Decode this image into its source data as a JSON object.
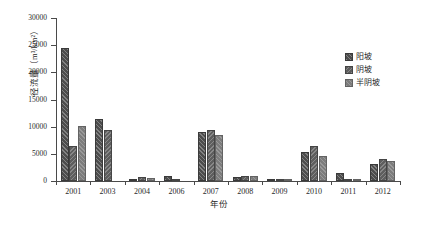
{
  "chart_data": {
    "type": "bar",
    "title": "",
    "xlabel": "年份",
    "ylabel": "径流量（m³/km²）",
    "ylim": [
      0,
      30000
    ],
    "ytick_values": [
      0,
      5000,
      10000,
      15000,
      20000,
      25000,
      30000
    ],
    "ytick_labels": [
      "0",
      "5000",
      "10000",
      "15000",
      "20000",
      "25000",
      "30000"
    ],
    "grid": false,
    "legend_position": "upper right",
    "categories": [
      "2001",
      "2003",
      "2004",
      "2006",
      "2007",
      "2008",
      "2009",
      "2010",
      "2011",
      "2012"
    ],
    "series": [
      {
        "name": "阳坡",
        "color": "#4d4d4d",
        "values": [
          24500,
          11500,
          450,
          900,
          9000,
          700,
          150,
          5300,
          1400,
          3100
        ]
      },
      {
        "name": "阴坡",
        "color": "#5e5e5e",
        "values": [
          6400,
          9300,
          800,
          300,
          9400,
          900,
          250,
          6400,
          250,
          4000
        ]
      },
      {
        "name": "半阴坡",
        "color": "#7d7d7d",
        "values": [
          10100,
          0,
          600,
          0,
          8500,
          850,
          200,
          4600,
          100,
          3700
        ]
      }
    ]
  },
  "legend": {
    "items": [
      {
        "label": "阳坡"
      },
      {
        "label": "阴坡"
      },
      {
        "label": "半阴坡"
      }
    ]
  },
  "caption": ""
}
